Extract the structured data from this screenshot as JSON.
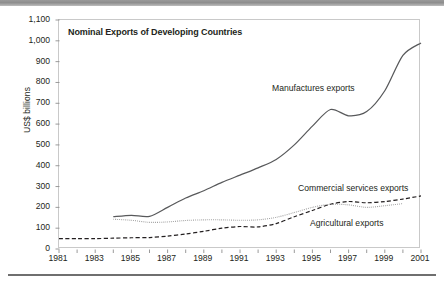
{
  "figure": {
    "title": "Nominal Exports of Developing Countries",
    "ylabel": "US$ billions"
  },
  "labels": {
    "manufactures": "Manufactures exports",
    "commercial": "Commercial services exports",
    "agricultural": "Agricultural exports"
  },
  "chart_data": {
    "type": "line",
    "title": "Nominal Exports of Developing Countries",
    "xlabel": "",
    "ylabel": "US$ billions",
    "xlim": [
      1981,
      2001
    ],
    "ylim": [
      0,
      1100
    ],
    "grid": false,
    "legend_position": "inline-annotations",
    "xticks": [
      "1981",
      "1983",
      "1985",
      "1987",
      "1989",
      "1991",
      "1993",
      "1995",
      "1997",
      "1999",
      "2001"
    ],
    "yticks": [
      "0",
      "100",
      "200",
      "300",
      "400",
      "500",
      "600",
      "700",
      "800",
      "900",
      "1,000",
      "1,100"
    ],
    "x": [
      1981,
      1982,
      1983,
      1984,
      1985,
      1986,
      1987,
      1988,
      1989,
      1990,
      1991,
      1992,
      1993,
      1994,
      1995,
      1996,
      1997,
      1998,
      1999,
      2000,
      2001
    ],
    "series": [
      {
        "name": "Manufactures exports",
        "style": "solid",
        "color": "#58595b",
        "values": [
          null,
          null,
          null,
          155,
          162,
          157,
          200,
          245,
          280,
          320,
          355,
          390,
          430,
          500,
          590,
          670,
          640,
          660,
          760,
          930,
          990
        ]
      },
      {
        "name": "Commercial services exports",
        "style": "dashed",
        "color": "#231f20",
        "values": [
          50,
          50,
          50,
          52,
          54,
          55,
          62,
          72,
          85,
          100,
          108,
          106,
          122,
          155,
          185,
          215,
          228,
          222,
          228,
          240,
          255
        ]
      },
      {
        "name": "Agricultural exports",
        "style": "dotted",
        "color": "#9c9c9c",
        "values": [
          null,
          null,
          null,
          143,
          138,
          128,
          130,
          137,
          140,
          140,
          138,
          140,
          152,
          175,
          200,
          215,
          212,
          200,
          208,
          218,
          null
        ]
      }
    ]
  }
}
